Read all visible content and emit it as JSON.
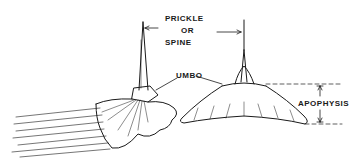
{
  "figure": {
    "ink_color": "#1a1a1a",
    "background": "#ffffff"
  },
  "labels": {
    "prickle": "PRICKLE",
    "or": "OR",
    "spine": "SPINE",
    "umbo": "UMBO",
    "apophysis": "APOPHYSIS"
  },
  "views": [
    {
      "name": "side-view",
      "position": "left"
    },
    {
      "name": "front-view",
      "position": "right"
    }
  ]
}
